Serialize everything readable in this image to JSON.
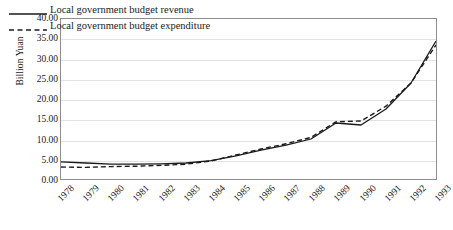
{
  "chart_data": {
    "type": "line",
    "title": "",
    "xlabel": "",
    "ylabel": "Billion Yuan",
    "ylim": [
      0,
      40
    ],
    "ytick_step": 5,
    "ytick_labels": [
      "0.00",
      "5.00",
      "10.00",
      "15.00",
      "20.00",
      "25.00",
      "30.00",
      "35.00",
      "40.00"
    ],
    "grid": "horizontal",
    "legend_position": "top-left",
    "categories": [
      "1978",
      "1979",
      "1980",
      "1981",
      "1982",
      "1983",
      "1984",
      "1985",
      "1986",
      "1987",
      "1988",
      "1989",
      "1990",
      "1991",
      "1992",
      "1993"
    ],
    "series": [
      {
        "name": "Local government budget revenue",
        "style": "solid",
        "color": "#1a1a1a",
        "values": [
          4.3,
          4.0,
          3.7,
          3.7,
          3.8,
          4.0,
          4.6,
          5.8,
          7.2,
          8.5,
          10.0,
          14.0,
          13.5,
          17.5,
          24.0,
          34.5
        ]
      },
      {
        "name": "Local government budget expenditure",
        "style": "dashed",
        "color": "#1a1a1a",
        "values": [
          3.0,
          2.9,
          3.1,
          3.2,
          3.4,
          3.7,
          4.5,
          6.0,
          7.5,
          8.8,
          10.4,
          14.3,
          14.5,
          18.2,
          24.0,
          33.5
        ]
      }
    ]
  },
  "legend": {
    "items": [
      {
        "label": "Local government budget revenue",
        "style": "solid"
      },
      {
        "label": "Local government budget expenditure",
        "style": "dashed"
      }
    ]
  },
  "axis": {
    "y_title": "Billion Yuan"
  }
}
